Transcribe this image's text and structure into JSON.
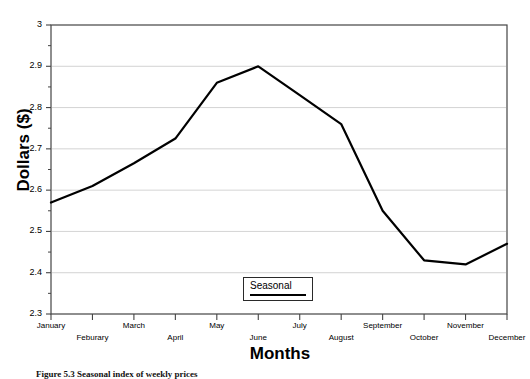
{
  "figure": {
    "caption": "Figure 5.3 Seasonal index of weekly prices"
  },
  "chart_data": {
    "type": "line",
    "title": "",
    "xlabel": "Months",
    "ylabel": "Dollars ($)",
    "categories": [
      "January",
      "Feburary",
      "March",
      "April",
      "May",
      "June",
      "July",
      "August",
      "September",
      "October",
      "November",
      "December"
    ],
    "series": [
      {
        "name": "Seasonal",
        "color": "#000000",
        "values": [
          2.57,
          2.61,
          2.665,
          2.725,
          2.86,
          2.9,
          2.83,
          2.76,
          2.55,
          2.43,
          2.42,
          2.47
        ]
      }
    ],
    "ylim": [
      2.3,
      3.0
    ],
    "yticks": [
      2.3,
      2.4,
      2.5,
      2.6,
      2.7,
      2.8,
      2.9,
      3.0
    ],
    "ytick_labels": [
      "2.3",
      "2.4",
      "2.5",
      "2.6",
      "2.7",
      "2.8",
      "2.9",
      "3"
    ],
    "y_minor_ticks": true,
    "grid": "horizontal",
    "grid_color": "#c8c8c8",
    "axis_color": "#444444",
    "legend": {
      "label": "Seasonal",
      "position": "bottom-center"
    }
  }
}
